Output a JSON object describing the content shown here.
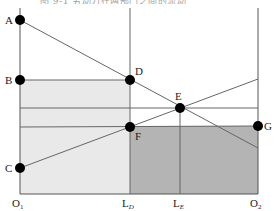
{
  "diagram": {
    "title": "图 9-1 劳动力在两部门之间的流动",
    "colors": {
      "light_region": "#e9e9e9",
      "dark_region": "#b4b4b4",
      "line": "#666666",
      "axis": "#555555",
      "point": "#000000"
    },
    "points": [
      {
        "id": "A",
        "label": "A",
        "x": 20,
        "y": 20
      },
      {
        "id": "B",
        "label": "B",
        "x": 20,
        "y": 80
      },
      {
        "id": "C",
        "label": "C",
        "x": 20,
        "y": 168
      },
      {
        "id": "D",
        "label": "D",
        "x": 130,
        "y": 80
      },
      {
        "id": "E",
        "label": "E",
        "x": 180,
        "y": 108
      },
      {
        "id": "F",
        "label": "F",
        "x": 130,
        "y": 127
      },
      {
        "id": "G",
        "label": "G",
        "x": 258,
        "y": 126
      }
    ],
    "axis_labels": {
      "o1": "O",
      "o1_sub": "1",
      "ld": "L",
      "ld_sub": "D",
      "le": "L",
      "le_sub": "E",
      "o2": "O",
      "o2_sub": "2"
    },
    "point_labels": {
      "A": "A",
      "B": "B",
      "C": "C",
      "D": "D",
      "E": "E",
      "F": "F",
      "G": "G"
    }
  }
}
